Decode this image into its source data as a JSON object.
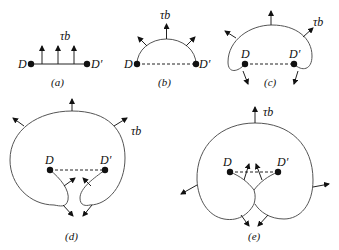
{
  "figure": {
    "force_label": "τb",
    "pin_left": "D",
    "pin_right": "D′",
    "panels": [
      {
        "id": "a",
        "caption": "(a)"
      },
      {
        "id": "b",
        "caption": "(b)"
      },
      {
        "id": "c",
        "caption": "(c)"
      },
      {
        "id": "d",
        "caption": "(d)"
      },
      {
        "id": "e",
        "caption": "(e)"
      }
    ],
    "colors": {
      "line": "#222222",
      "curve": "#555555",
      "dot": "#111111"
    }
  }
}
